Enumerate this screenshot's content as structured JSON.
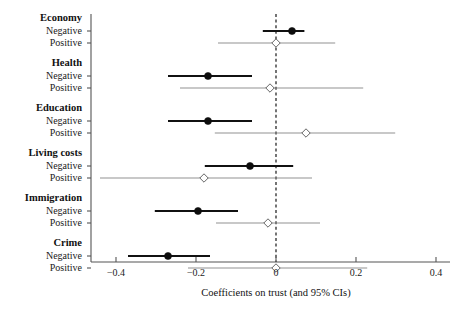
{
  "chart_data": {
    "type": "scatter",
    "title": "",
    "subtitle": "",
    "xlabel": "Coefficients on trust (and 95% CIs)",
    "ylabel": "",
    "xlim": [
      -0.47,
      0.47
    ],
    "xticks": [
      -0.4,
      -0.2,
      0,
      0.2,
      0.4
    ],
    "xticklabels": [
      "−0.4",
      "−0.2",
      "0",
      "0.2",
      "0.4"
    ],
    "grid": false,
    "legend": null,
    "reference_line": {
      "x": 0,
      "style": "dashed"
    },
    "groups": [
      {
        "name": "Economy",
        "rows": [
          {
            "label": "Negative",
            "estimate": 0.04,
            "ci_low": -0.033,
            "ci_high": 0.071,
            "marker": "filled-circle"
          },
          {
            "label": "Positive",
            "estimate": 0.0,
            "ci_low": -0.145,
            "ci_high": 0.148,
            "marker": "open-diamond"
          }
        ]
      },
      {
        "name": "Health",
        "rows": [
          {
            "label": "Negative",
            "estimate": -0.17,
            "ci_low": -0.27,
            "ci_high": -0.06,
            "marker": "filled-circle"
          },
          {
            "label": "Positive",
            "estimate": -0.015,
            "ci_low": -0.24,
            "ci_high": 0.218,
            "marker": "open-diamond"
          }
        ]
      },
      {
        "name": "Education",
        "rows": [
          {
            "label": "Negative",
            "estimate": -0.17,
            "ci_low": -0.27,
            "ci_high": -0.06,
            "marker": "filled-circle"
          },
          {
            "label": "Positive",
            "estimate": 0.075,
            "ci_low": -0.153,
            "ci_high": 0.298,
            "marker": "open-diamond"
          }
        ]
      },
      {
        "name": "Living costs",
        "rows": [
          {
            "label": "Negative",
            "estimate": -0.065,
            "ci_low": -0.178,
            "ci_high": 0.043,
            "marker": "filled-circle"
          },
          {
            "label": "Positive",
            "estimate": -0.18,
            "ci_low": -0.44,
            "ci_high": 0.09,
            "marker": "open-diamond"
          }
        ]
      },
      {
        "name": "Immigration",
        "rows": [
          {
            "label": "Negative",
            "estimate": -0.195,
            "ci_low": -0.303,
            "ci_high": -0.095,
            "marker": "filled-circle"
          },
          {
            "label": "Positive",
            "estimate": -0.02,
            "ci_low": -0.15,
            "ci_high": 0.11,
            "marker": "open-diamond"
          }
        ]
      },
      {
        "name": "Crime",
        "rows": [
          {
            "label": "Negative",
            "estimate": -0.27,
            "ci_low": -0.37,
            "ci_high": -0.165,
            "marker": "filled-circle"
          },
          {
            "label": "Positive",
            "estimate": 0.0,
            "ci_low": -0.22,
            "ci_high": 0.228,
            "marker": "open-diamond"
          }
        ]
      }
    ],
    "colors": {
      "negative_marker": "#0d0d0d",
      "positive_marker": "#ffffff",
      "negative_ci": "#111111",
      "positive_ci": "#7d7d7d",
      "zero_line": "#2a2a2a",
      "axis": "#555555",
      "background": "#ffffff"
    }
  }
}
